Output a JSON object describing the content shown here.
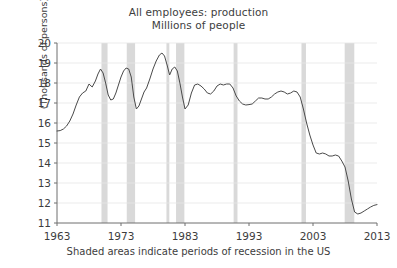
{
  "chart_data": {
    "type": "line",
    "title": "All employees: production",
    "subtitle": "Millions of people",
    "xlabel": "",
    "ylabel": "(Thousands of persons)",
    "caption": "Shaded areas indicate periods of recession in the US",
    "xlim": [
      1963,
      2013
    ],
    "ylim": [
      11,
      20
    ],
    "grid": true,
    "legend": "none",
    "xticks": [
      "1963",
      "1973",
      "1983",
      "1993",
      "2003",
      "2013"
    ],
    "xtick_values": [
      1963,
      1973,
      1983,
      1993,
      2003,
      2013
    ],
    "yticks": [
      "11",
      "12",
      "13",
      "14",
      "15",
      "16",
      "17",
      "18",
      "19",
      "20"
    ],
    "ytick_values": [
      11,
      12,
      13,
      14,
      15,
      16,
      17,
      18,
      19,
      20
    ],
    "line_color": "#4a4a4a",
    "recession_band_color": "#d9d9d9",
    "grid_color": "#e6e6e6",
    "axis_color": "#6e6e6e",
    "series": [
      {
        "name": "All employees: production",
        "x": [
          1963.0,
          1963.5,
          1964.0,
          1964.5,
          1965.0,
          1965.5,
          1966.0,
          1966.5,
          1967.0,
          1967.5,
          1968.0,
          1968.5,
          1969.0,
          1969.4,
          1969.8,
          1970.2,
          1970.6,
          1971.0,
          1971.4,
          1971.8,
          1972.2,
          1972.6,
          1973.0,
          1973.4,
          1973.8,
          1974.2,
          1974.6,
          1975.0,
          1975.4,
          1975.8,
          1976.2,
          1976.6,
          1977.0,
          1977.5,
          1978.0,
          1978.5,
          1979.0,
          1979.4,
          1979.8,
          1980.2,
          1980.6,
          1981.0,
          1981.4,
          1981.8,
          1982.2,
          1982.6,
          1983.0,
          1983.5,
          1984.0,
          1984.5,
          1985.0,
          1985.5,
          1986.0,
          1986.5,
          1987.0,
          1987.5,
          1988.0,
          1988.5,
          1989.0,
          1989.5,
          1990.0,
          1990.5,
          1991.0,
          1991.5,
          1992.0,
          1992.5,
          1993.0,
          1993.5,
          1994.0,
          1994.5,
          1995.0,
          1995.5,
          1996.0,
          1996.5,
          1997.0,
          1997.5,
          1998.0,
          1998.5,
          1999.0,
          1999.5,
          2000.0,
          2000.5,
          2001.0,
          2001.5,
          2002.0,
          2002.5,
          2003.0,
          2003.5,
          2004.0,
          2004.5,
          2005.0,
          2005.5,
          2006.0,
          2006.5,
          2007.0,
          2007.5,
          2008.0,
          2008.5,
          2009.0,
          2009.5,
          2010.0,
          2010.5,
          2011.0,
          2011.5,
          2012.0,
          2012.5,
          2013.0
        ],
        "y": [
          15.6,
          15.62,
          15.7,
          15.85,
          16.1,
          16.45,
          16.9,
          17.3,
          17.5,
          17.6,
          17.95,
          17.8,
          18.1,
          18.45,
          18.7,
          18.5,
          18.0,
          17.4,
          17.15,
          17.2,
          17.5,
          17.9,
          18.3,
          18.6,
          18.75,
          18.7,
          18.3,
          17.3,
          16.7,
          16.85,
          17.2,
          17.55,
          17.75,
          18.2,
          18.7,
          19.1,
          19.4,
          19.5,
          19.35,
          18.9,
          18.4,
          18.7,
          18.8,
          18.6,
          18.0,
          17.3,
          16.7,
          16.9,
          17.5,
          17.9,
          17.95,
          17.85,
          17.7,
          17.5,
          17.45,
          17.6,
          17.85,
          17.95,
          17.9,
          17.95,
          17.95,
          17.75,
          17.35,
          17.1,
          16.95,
          16.9,
          16.92,
          16.95,
          17.1,
          17.25,
          17.25,
          17.2,
          17.2,
          17.3,
          17.45,
          17.55,
          17.6,
          17.55,
          17.45,
          17.5,
          17.6,
          17.55,
          17.3,
          16.7,
          16.0,
          15.4,
          14.9,
          14.5,
          14.45,
          14.5,
          14.45,
          14.35,
          14.35,
          14.4,
          14.35,
          14.1,
          13.8,
          13.1,
          12.2,
          11.55,
          11.45,
          11.5,
          11.6,
          11.7,
          11.8,
          11.88,
          11.92
        ]
      }
    ],
    "recessions": [
      {
        "label": "1969-1970",
        "start": 1969.95,
        "end": 1970.9
      },
      {
        "label": "1973-1975",
        "start": 1973.9,
        "end": 1975.2
      },
      {
        "label": "1980",
        "start": 1980.1,
        "end": 1980.55
      },
      {
        "label": "1981-1982",
        "start": 1981.6,
        "end": 1982.9
      },
      {
        "label": "1990-1991",
        "start": 1990.6,
        "end": 1991.2
      },
      {
        "label": "2001",
        "start": 2001.2,
        "end": 2001.9
      },
      {
        "label": "2007-2009",
        "start": 2007.95,
        "end": 2009.45
      }
    ]
  }
}
